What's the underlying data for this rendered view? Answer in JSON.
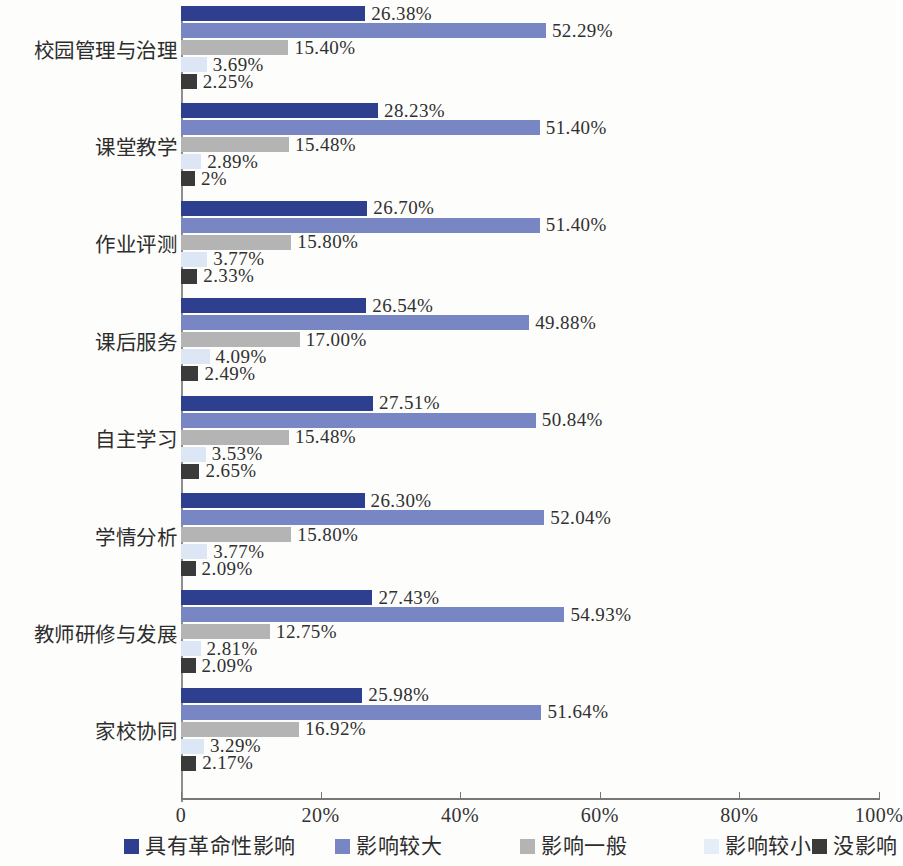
{
  "chart_data": {
    "type": "bar",
    "orientation": "horizontal",
    "title": "",
    "subtitle": "",
    "xlabel": "",
    "ylabel": "",
    "xlim": [
      0,
      100
    ],
    "grid": false,
    "legend_position": "bottom",
    "xtick_labels": [
      "0",
      "20%",
      "40%",
      "60%",
      "80%",
      "100%"
    ],
    "xtick_values": [
      0,
      20,
      40,
      60,
      80,
      100
    ],
    "categories": [
      "校园管理与治理",
      "课堂教学",
      "作业评测",
      "课后服务",
      "自主学习",
      "学情分析",
      "教师研修与发展",
      "家校协同"
    ],
    "series": [
      {
        "name": "具有革命性影响",
        "color": "#2e3f8f",
        "values": [
          26.38,
          28.23,
          26.7,
          26.54,
          27.51,
          26.3,
          27.43,
          25.98
        ],
        "labels": [
          "26.38%",
          "28.23%",
          "26.70%",
          "26.54%",
          "27.51%",
          "26.30%",
          "27.43%",
          "25.98%"
        ]
      },
      {
        "name": "影响较大",
        "color": "#7886c4",
        "values": [
          52.29,
          51.4,
          51.4,
          49.88,
          50.84,
          52.04,
          54.93,
          51.64
        ],
        "labels": [
          "52.29%",
          "51.40%",
          "51.40%",
          "49.88%",
          "50.84%",
          "52.04%",
          "54.93%",
          "51.64%"
        ]
      },
      {
        "name": "影响一般",
        "color": "#b4b4b4",
        "values": [
          15.4,
          15.48,
          15.8,
          17.0,
          15.48,
          15.8,
          12.75,
          16.92
        ],
        "labels": [
          "15.40%",
          "15.48%",
          "15.80%",
          "17.00%",
          "15.48%",
          "15.80%",
          "12.75%",
          "16.92%"
        ]
      },
      {
        "name": "影响较小",
        "color": "#dce6f4",
        "values": [
          3.69,
          2.89,
          3.77,
          4.09,
          3.53,
          3.77,
          2.81,
          3.29
        ],
        "labels": [
          "3.69%",
          "2.89%",
          "3.77%",
          "4.09%",
          "3.53%",
          "3.77%",
          "2.81%",
          "3.29%"
        ]
      },
      {
        "name": "没影响",
        "color": "#3a3a3a",
        "values": [
          2.25,
          2.0,
          2.33,
          2.49,
          2.65,
          2.09,
          2.09,
          2.17
        ],
        "labels": [
          "2.25%",
          "2%",
          "2.33%",
          "2.49%",
          "2.65%",
          "2.09%",
          "2.09%",
          "2.17%"
        ]
      }
    ]
  },
  "legend": {
    "items": [
      {
        "label": "具有革命性影响",
        "color": "#2e3f8f"
      },
      {
        "label": "影响较大",
        "color": "#7886c4"
      },
      {
        "label": "影响一般",
        "color": "#b4b4b4"
      },
      {
        "label": "影响较小",
        "color": "#e4edf8"
      },
      {
        "label": "没影响",
        "color": "#3a3a3a"
      }
    ]
  }
}
